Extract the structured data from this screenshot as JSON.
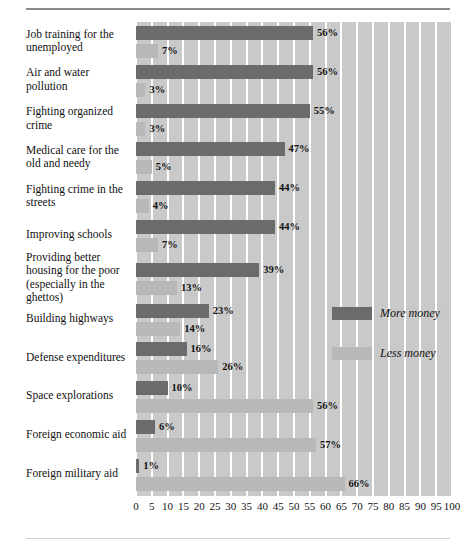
{
  "chart_data": {
    "type": "bar",
    "orientation": "horizontal",
    "title": "",
    "subtitle": "",
    "xlabel": "",
    "ylabel": "",
    "xlim": [
      0,
      100
    ],
    "xticks": [
      0,
      5,
      10,
      15,
      20,
      25,
      30,
      35,
      40,
      45,
      50,
      55,
      60,
      65,
      70,
      75,
      80,
      85,
      90,
      95,
      100
    ],
    "xtick_labels": [
      "0",
      "5",
      "10",
      "15",
      "20",
      "25",
      "30",
      "35",
      "40",
      "45",
      "50",
      "55",
      "60",
      "65",
      "70",
      "75",
      "80",
      "85",
      "90",
      "95",
      "100"
    ],
    "grid": true,
    "grid_axis": "x",
    "legend_position": "inside-right",
    "value_label_suffix": "%",
    "categories": [
      "Job training for the unemployed",
      "Air and water pollution",
      "Fighting organized crime",
      "Medical care for the old and needy",
      "Fighting crime in the streets",
      "Improving schools",
      "Providing better housing for the poor (especially in the ghettos)",
      "Building highways",
      "Defense expenditures",
      "Space explorations",
      "Foreign economic aid",
      "Foreign military aid"
    ],
    "series": [
      {
        "name": "More money",
        "color": "#6b6b6b",
        "values": [
          56,
          56,
          55,
          47,
          44,
          44,
          39,
          23,
          16,
          10,
          6,
          1
        ],
        "labels": [
          "56%",
          "56%",
          "55%",
          "47%",
          "44%",
          "44%",
          "39%",
          "23%",
          "16%",
          "10%",
          "6%",
          "1%"
        ]
      },
      {
        "name": "Less money",
        "color": "#b8b8b8",
        "values": [
          7,
          3,
          3,
          5,
          4,
          7,
          13,
          14,
          26,
          56,
          57,
          66
        ],
        "labels": [
          "7%",
          "3%",
          "3%",
          "5%",
          "4%",
          "7%",
          "13%",
          "14%",
          "26%",
          "56%",
          "57%",
          "66%"
        ]
      }
    ],
    "category_label_lines": [
      [
        "Job training for the",
        "unemployed"
      ],
      [
        "Air and water",
        "pollution"
      ],
      [
        "Fighting organized",
        "crime"
      ],
      [
        "Medical care for the",
        "old and needy"
      ],
      [
        "Fighting crime in the",
        "streets"
      ],
      [
        "Improving schools"
      ],
      [
        "Providing better",
        "housing for the poor",
        "(especially in the",
        "ghettos)"
      ],
      [
        "Building highways"
      ],
      [
        "Defense expenditures"
      ],
      [
        "Space explorations"
      ],
      [
        "Foreign economic aid"
      ],
      [
        "Foreign military aid"
      ]
    ],
    "legend": [
      {
        "label": "More money",
        "color": "#6b6b6b"
      },
      {
        "label": "Less money",
        "color": "#b8b8b8"
      }
    ],
    "colors": {
      "more_money": "#6b6b6b",
      "less_money": "#b8b8b8",
      "plot_background": "#c9c9c9",
      "gridline": "#ffffff",
      "text": "#111111",
      "rule": "#8a8a8a"
    }
  }
}
